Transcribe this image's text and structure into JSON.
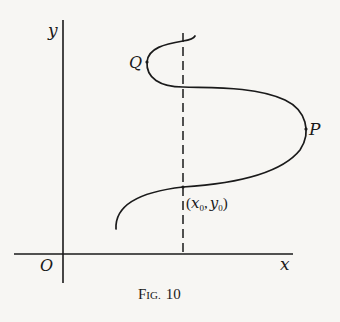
{
  "figure": {
    "caption_prefix": "F",
    "caption_small": "IG.",
    "caption_number": "10",
    "caption": "FIG. 10"
  },
  "axes": {
    "x_label": "x",
    "y_label": "y",
    "origin_label": "O"
  },
  "points": {
    "Q": "Q",
    "P": "P",
    "x0y0": {
      "open": "(",
      "x": "x",
      "x_sub": "0",
      "comma": ",",
      "y": "y",
      "y_sub": "0",
      "close": ")"
    }
  },
  "colors": {
    "ink": "#1a1a1a",
    "paper": "#f7f6f3"
  }
}
